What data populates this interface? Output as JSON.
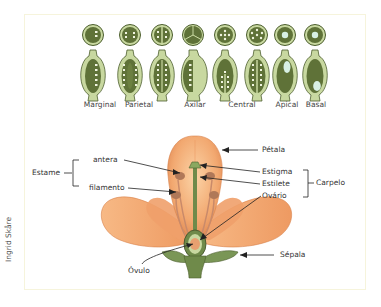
{
  "figure": {
    "credit": "Ingrid Skåre",
    "placentation": {
      "types": [
        {
          "label": "Marginal",
          "x": 100
        },
        {
          "label": "Parietal",
          "x": 139
        },
        {
          "label": "Axilar",
          "x": 195
        },
        {
          "label": "Central",
          "x": 242
        },
        {
          "label": "Apical",
          "x": 287
        },
        {
          "label": "Basal",
          "x": 316
        }
      ]
    },
    "flower_labels": {
      "estame": "Estame",
      "antera": "antera",
      "filamento": "filamento",
      "petala": "Pétala",
      "estigma": "Estigma",
      "estilete": "Estilete",
      "ovario": "Ovário",
      "carpelo": "Carpelo",
      "ovulo": "Óvulo",
      "sepala": "Sépala"
    },
    "colors": {
      "petal": "#f2a870",
      "petal_light": "#f8c99a",
      "pistil_green": "#6f8a4a",
      "dark_green": "#4c5e2e",
      "light_green": "#cfe0a8",
      "frame_border": "#f6f4dc"
    }
  }
}
